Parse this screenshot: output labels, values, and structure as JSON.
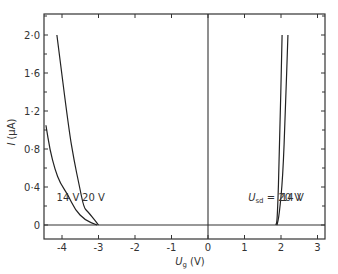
{
  "chart_data": {
    "type": "line",
    "title": "",
    "xlabel": "U_g (V)",
    "xlabel_main": "U",
    "xlabel_sub": "g",
    "xlabel_unit": "(V)",
    "ylabel": "I (μA)",
    "ylabel_main": "I",
    "ylabel_unit": "(μA)",
    "xlim": [
      -4.5,
      3.2
    ],
    "ylim": [
      -0.15,
      2.2
    ],
    "grid": false,
    "legend": "none (curves labeled inline)",
    "x_ticks": [
      -4,
      -3,
      -2,
      -1,
      0,
      1,
      2,
      3
    ],
    "x_tick_labels": [
      "-4",
      "-3",
      "-2",
      "-1",
      "0",
      "1",
      "2",
      "3"
    ],
    "y_ticks": [
      0,
      0.4,
      0.8,
      1.2,
      1.6,
      2.0
    ],
    "y_tick_labels": [
      "0",
      "0·4",
      "0·8",
      "1·2",
      "1·6",
      "2·0"
    ],
    "reference_lines": {
      "horizontal_at_y": 0,
      "vertical_at_x": 0
    },
    "series": [
      {
        "name": "20 V (negative branch)",
        "x": [
          -4.14,
          -3.81,
          -3.67,
          -3.53,
          -3.4,
          -3.29,
          -3.06,
          -3.0
        ],
        "y": [
          2.0,
          1.0,
          0.68,
          0.42,
          0.18,
          0.14,
          0.03,
          0
        ]
      },
      {
        "name": "14 V (negative branch)",
        "x": [
          -4.44,
          -4.33,
          -4.19,
          -4.05,
          -3.84,
          -3.64,
          -3.37,
          -3.04
        ],
        "y": [
          1.05,
          0.79,
          0.58,
          0.44,
          0.32,
          0.16,
          0.05,
          0
        ]
      },
      {
        "name": "20 V (positive branch)",
        "x": [
          1.86,
          1.9,
          1.96,
          2.03
        ],
        "y": [
          0,
          0.05,
          0.8,
          2.0
        ]
      },
      {
        "name": "14 V (positive branch)",
        "x": [
          1.89,
          1.95,
          2.05,
          2.12,
          2.19
        ],
        "y": [
          0,
          0.1,
          0.5,
          1.2,
          2.0
        ]
      }
    ],
    "annotations": [
      {
        "text": "14 V",
        "x": -4.15,
        "y": 0.25
      },
      {
        "text": "20 V",
        "x": -3.45,
        "y": 0.25
      },
      {
        "text_main": "U",
        "text_sub": "sd",
        "text_rest": " = 20 V",
        "x": 1.1,
        "y": 0.25
      },
      {
        "text": "14 V",
        "x": 2.0,
        "y": 0.25
      }
    ]
  }
}
